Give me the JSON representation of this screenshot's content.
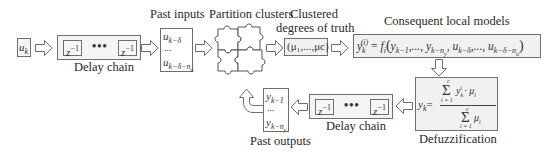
{
  "input": {
    "symbol": "u",
    "subscript": "k"
  },
  "delay_chain_top": {
    "label": "Delay chain",
    "element_left": "z",
    "element_right": "z",
    "exponent": "−1",
    "ellipsis": "•••"
  },
  "past_inputs": {
    "label": "Past inputs",
    "first": {
      "symbol": "u",
      "subscript": "k−δ"
    },
    "ellipsis": "...",
    "last": {
      "symbol": "u",
      "subscript": "k−δ−n",
      "subsub": "u"
    }
  },
  "partition": {
    "label": "Partition clusters",
    "icon": "puzzle-icon"
  },
  "clustered": {
    "label_line1": "Clustered",
    "label_line2": "degrees of truth",
    "formula": "(μ₁,...,μc)"
  },
  "consequent": {
    "label": "Consequent local models",
    "formula": "y_k^(i) = f_i(y_{k−1},..., y_{k−n_y}, u_{k−δ},..., u_{k−δ−n_u})"
  },
  "defuzzification": {
    "label": "Defuzzification",
    "lhs": "y",
    "lhs_sub": "k",
    "numerator": "Σ y_k^i · μ_i",
    "denominator": "Σ μ_i",
    "sum_upper": "c",
    "sum_lower": "i = 1"
  },
  "delay_chain_bottom": {
    "label": "Delay chain",
    "element_left": "z",
    "element_right": "z",
    "exponent": "−1",
    "ellipsis": "•••"
  },
  "past_outputs": {
    "label": "Past outputs",
    "first": {
      "symbol": "y",
      "subscript": "k−1"
    },
    "ellipsis": "...",
    "last": {
      "symbol": "y",
      "subscript": "k−n",
      "subsub": "y"
    }
  },
  "colors": {
    "stroke": "#6f6f6f",
    "fill": "#f1f1f1",
    "text": "#2a2a2a"
  }
}
